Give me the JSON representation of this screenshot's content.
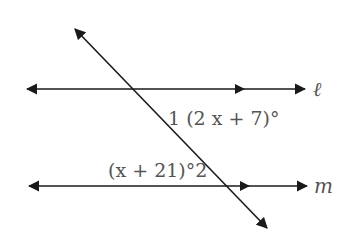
{
  "diagram": {
    "type": "parallel-lines-with-transversal",
    "colors": {
      "line": "#1a1a1a",
      "text": "#555555",
      "background": "#ffffff"
    },
    "lines": {
      "l": {
        "label": "ℓ",
        "name": "line l",
        "y": 89,
        "x1": 27,
        "x2": 305
      },
      "m": {
        "label": "m",
        "name": "line m",
        "y": 186,
        "x1": 29,
        "x2": 307
      },
      "transversal": {
        "name": "transversal",
        "x1": 75,
        "y1": 29,
        "x2": 267,
        "y2": 228
      }
    },
    "angles": {
      "angle1": {
        "number": "1",
        "expression": "(2x+7)°",
        "display": "1 (2 x + 7)°"
      },
      "angle2": {
        "number": "2",
        "expression": "(x+21)°",
        "display": "(x + 21)°2"
      }
    }
  }
}
